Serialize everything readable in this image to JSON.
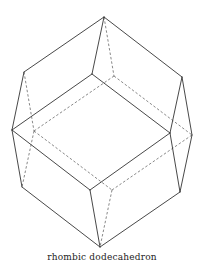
{
  "caption": "rhombic dodecahedron",
  "colors": {
    "stroke": "#333333",
    "background": "#ffffff"
  },
  "vertices": {
    "T": [
      104,
      17
    ],
    "A": [
      24,
      72
    ],
    "B": [
      92,
      74
    ],
    "C": [
      182,
      77
    ],
    "D": [
      114,
      76
    ],
    "E": [
      12,
      130
    ],
    "G": [
      34,
      131
    ],
    "F": [
      170,
      133
    ],
    "H": [
      192,
      135
    ],
    "K": [
      22,
      187
    ],
    "J": [
      90,
      190
    ],
    "M": [
      112,
      190
    ],
    "L": [
      180,
      192
    ],
    "Bt": [
      100,
      247
    ]
  },
  "edges_solid": [
    [
      "T",
      "A"
    ],
    [
      "T",
      "B"
    ],
    [
      "T",
      "C"
    ],
    [
      "A",
      "E"
    ],
    [
      "B",
      "E"
    ],
    [
      "B",
      "F"
    ],
    [
      "C",
      "F"
    ],
    [
      "C",
      "H"
    ],
    [
      "E",
      "K"
    ],
    [
      "E",
      "J"
    ],
    [
      "F",
      "J"
    ],
    [
      "F",
      "L"
    ],
    [
      "H",
      "L"
    ],
    [
      "K",
      "Bt"
    ],
    [
      "J",
      "Bt"
    ],
    [
      "L",
      "Bt"
    ]
  ],
  "edges_dashed": [
    [
      "T",
      "D"
    ],
    [
      "D",
      "G"
    ],
    [
      "D",
      "H"
    ],
    [
      "A",
      "G"
    ],
    [
      "G",
      "K"
    ],
    [
      "G",
      "M"
    ],
    [
      "M",
      "H"
    ],
    [
      "M",
      "Bt"
    ]
  ]
}
